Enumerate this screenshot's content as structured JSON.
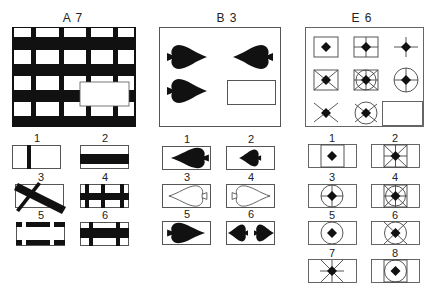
{
  "problems": [
    {
      "id": "A7",
      "title": "A 7",
      "matrix": {
        "description": "Black grid of horizontal and vertical bars with a missing rectangular piece"
      },
      "options": [
        {
          "number": "1",
          "description": "single vertical black bar"
        },
        {
          "number": "2",
          "description": "wide horizontal black band"
        },
        {
          "number": "3",
          "description": "tilted black bar crossing rectangle"
        },
        {
          "number": "4",
          "description": "horizontal band with three vertical bars"
        },
        {
          "number": "5",
          "description": "top and bottom bands with white gaps"
        },
        {
          "number": "6",
          "description": "horizontal band with two vertical bars"
        }
      ]
    },
    {
      "id": "B3",
      "title": "B 3",
      "matrix": {
        "description": "Spade shapes pointing right and left, with a missing bottom-right cell"
      },
      "options": [
        {
          "number": "1",
          "description": "large black spade pointing left"
        },
        {
          "number": "2",
          "description": "small black spade pointing left"
        },
        {
          "number": "3",
          "description": "outlined spade pointing left"
        },
        {
          "number": "4",
          "description": "outlined spade pointing right"
        },
        {
          "number": "5",
          "description": "large black spade pointing right"
        },
        {
          "number": "6",
          "description": "two small black spades facing each other"
        }
      ]
    },
    {
      "id": "E6",
      "title": "E 6",
      "matrix": {
        "description": "3x3 grid of diamonds combined with square, cross, circle and diagonal overlays; bottom-right missing"
      },
      "options": [
        {
          "number": "1",
          "description": "diamond in square"
        },
        {
          "number": "2",
          "description": "diamond in square with cross and diagonals"
        },
        {
          "number": "3",
          "description": "diamond in circle with cross"
        },
        {
          "number": "4",
          "description": "diamond in square with circle, cross and diagonals"
        },
        {
          "number": "5",
          "description": "diamond in circle"
        },
        {
          "number": "6",
          "description": "diamond in circle with diagonals"
        },
        {
          "number": "7",
          "description": "diamond with cross and diagonals"
        },
        {
          "number": "8",
          "description": "diamond in circle inside square"
        }
      ]
    }
  ],
  "colors": {
    "ink": "#111111",
    "line": "#555555",
    "background": "#ffffff"
  }
}
